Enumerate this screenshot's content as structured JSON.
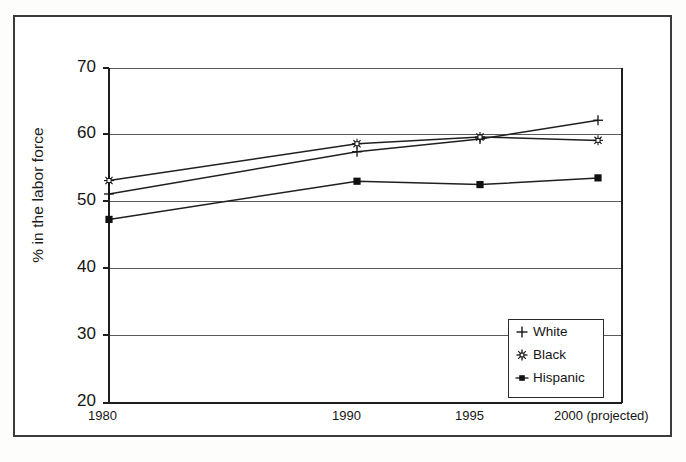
{
  "chart_data": {
    "type": "line",
    "title": "",
    "xlabel": "",
    "ylabel": "% in the labor force",
    "x": [
      "1980",
      "1990",
      "1995",
      "2000 (projected)"
    ],
    "categories": [
      "1980",
      "1990",
      "1995",
      "2000 (projected)"
    ],
    "xtick_labels": [
      "1980",
      "1990",
      "1995",
      "2000 (projected)"
    ],
    "ytick_labels": [
      "70",
      "60",
      "50",
      "40",
      "30",
      "20"
    ],
    "ylim": [
      20,
      70
    ],
    "ytick_values": [
      70,
      60,
      50,
      40,
      30,
      20
    ],
    "grid": "horizontal",
    "legend_position": "lower-right-inside",
    "series": [
      {
        "name": "White",
        "marker": "plus",
        "values": [
          51.2,
          57.5,
          59.4,
          62.2
        ]
      },
      {
        "name": "Black",
        "marker": "star",
        "values": [
          53.2,
          58.7,
          59.7,
          59.2
        ]
      },
      {
        "name": "Hispanic",
        "marker": "filled-square",
        "values": [
          47.4,
          53.1,
          52.6,
          53.6
        ]
      }
    ],
    "colors": {
      "line": "#202020",
      "grid": "#555555",
      "axis": "#202020",
      "background": "#ffffff",
      "frame": "#3b3b3b"
    }
  },
  "legend": {
    "items": [
      {
        "label": "White",
        "marker": "plus-marker-icon"
      },
      {
        "label": "Black",
        "marker": "star-marker-icon"
      },
      {
        "label": "Hispanic",
        "marker": "square-marker-icon"
      }
    ]
  },
  "axes": {
    "y_title": "% in the labor force",
    "y_ticks": [
      "70",
      "60",
      "50",
      "40",
      "30",
      "20"
    ],
    "x_ticks": [
      "1980",
      "1990",
      "1995",
      "2000 (projected)"
    ]
  }
}
